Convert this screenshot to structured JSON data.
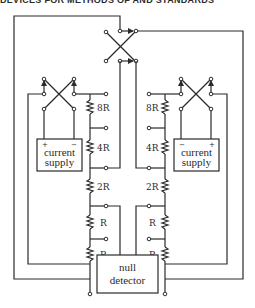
{
  "page_header": "DEVICES FOR METHODS OF AND STANDARDS",
  "diagram": {
    "left_chain": {
      "resistors": [
        "8R",
        "4R",
        "2R",
        "R",
        "R"
      ]
    },
    "right_chain": {
      "resistors": [
        "8R",
        "4R",
        "2R",
        "R",
        "R"
      ]
    },
    "left_supply": {
      "label_line1": "current",
      "label_line2": "supply",
      "pos_sign": "+",
      "neg_sign": "−"
    },
    "right_supply": {
      "label_line1": "current",
      "label_line2": "supply",
      "neg_sign": "−",
      "pos_sign": "+"
    },
    "detector": {
      "label_line1": "null",
      "label_line2": "detector"
    },
    "switches": [
      "top-reversing-switch",
      "left-reversing-switch",
      "right-reversing-switch"
    ],
    "colors": {
      "line": "#2b2b2b",
      "background": "#ffffff"
    }
  }
}
